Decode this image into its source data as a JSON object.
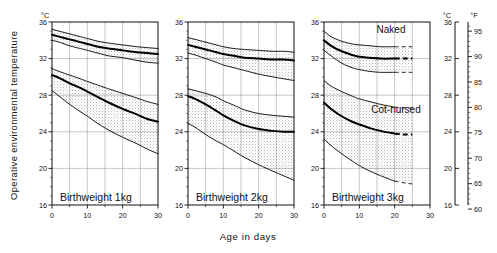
{
  "figure": {
    "ylabel": "Operative environmental temperature",
    "xlabel": "Age  in  days",
    "unit_left": "°C",
    "unit_right_c": "°C",
    "unit_right_f": "°F",
    "series_labels": {
      "naked": "Naked",
      "cot_nursed": "Cot-nursed"
    },
    "panels": [
      {
        "title": "Birthweight   1kg"
      },
      {
        "title": "Birthweight   2kg"
      },
      {
        "title": "Birthweight   3kg"
      }
    ]
  },
  "chart_data": {
    "type": "line",
    "xlabel": "Age in days",
    "ylabel": "Operative environmental temperature",
    "xlim": [
      0,
      30
    ],
    "ylim": [
      16,
      36
    ],
    "xticks": [
      0,
      10,
      20,
      30
    ],
    "xminorticks": [
      5,
      15,
      25
    ],
    "yticks": [
      16,
      20,
      24,
      28,
      32,
      36
    ],
    "y_unit": "°C",
    "secondary_axis": {
      "unit": "°F",
      "ticks": [
        60,
        65,
        70,
        75,
        80,
        85,
        90,
        95
      ],
      "lim": [
        60.8,
        96.8
      ]
    },
    "grid": true,
    "legend": "in-plot annotations",
    "annotations": [
      {
        "text": "Naked",
        "panel": 3,
        "x": 17.5,
        "y": 33.4
      },
      {
        "text": "Cot-nursed",
        "panel": 3,
        "x": 15.0,
        "y": 27.2
      },
      {
        "text": "Birthweight   1kg",
        "panel": 1,
        "x": 2.0,
        "y": 17.4
      },
      {
        "text": "Birthweight   2kg",
        "panel": 2,
        "x": 2.0,
        "y": 17.4
      },
      {
        "text": "Birthweight   3kg",
        "panel": 3,
        "x": 2.0,
        "y": 17.4
      }
    ],
    "panels": [
      {
        "name": "Birthweight 1kg",
        "x": [
          0,
          2,
          5,
          8,
          10,
          13,
          16,
          20,
          24,
          27,
          30
        ],
        "series": [
          {
            "name": "Naked upper",
            "style": "thin",
            "values": [
              35.2,
              35.0,
              34.7,
              34.4,
              34.2,
              33.9,
              33.7,
              33.5,
              33.3,
              33.2,
              33.1
            ]
          },
          {
            "name": "Naked mean",
            "style": "thick",
            "values": [
              34.6,
              34.4,
              34.1,
              33.8,
              33.6,
              33.3,
              33.1,
              32.9,
              32.7,
              32.6,
              32.5
            ]
          },
          {
            "name": "Naked lower",
            "style": "thin",
            "values": [
              34.0,
              33.8,
              33.4,
              33.1,
              32.9,
              32.6,
              32.3,
              32.1,
              31.8,
              31.6,
              31.5
            ]
          },
          {
            "name": "Cot-nursed upper",
            "style": "thin",
            "values": [
              30.9,
              30.6,
              30.2,
              29.8,
              29.5,
              29.1,
              28.7,
              28.2,
              27.7,
              27.3,
              27.0
            ]
          },
          {
            "name": "Cot-nursed mean",
            "style": "thick",
            "values": [
              30.2,
              29.9,
              29.3,
              28.8,
              28.4,
              27.8,
              27.2,
              26.5,
              25.9,
              25.4,
              25.1
            ]
          },
          {
            "name": "Cot-nursed lower",
            "style": "thin",
            "values": [
              28.5,
              27.9,
              27.0,
              26.2,
              25.7,
              24.9,
              24.2,
              23.4,
              22.7,
              22.1,
              21.6
            ]
          }
        ]
      },
      {
        "name": "Birthweight 2kg",
        "x": [
          0,
          2,
          5,
          8,
          10,
          13,
          16,
          20,
          24,
          27,
          30
        ],
        "series": [
          {
            "name": "Naked upper",
            "style": "thin",
            "values": [
              34.3,
              34.1,
              33.8,
              33.5,
              33.3,
              33.1,
              33.0,
              32.9,
              32.8,
              32.8,
              32.7
            ]
          },
          {
            "name": "Naked mean",
            "style": "thick",
            "values": [
              33.5,
              33.3,
              33.0,
              32.7,
              32.5,
              32.3,
              32.1,
              32.0,
              31.9,
              31.9,
              31.8
            ]
          },
          {
            "name": "Naked lower",
            "style": "thin",
            "values": [
              32.6,
              32.4,
              32.0,
              31.6,
              31.3,
              31.0,
              30.7,
              30.3,
              30.0,
              29.8,
              29.6
            ]
          },
          {
            "name": "Cot-nursed upper",
            "style": "thin",
            "values": [
              28.7,
              28.5,
              28.2,
              27.8,
              27.4,
              26.9,
              26.4,
              26.0,
              25.8,
              25.7,
              25.6
            ]
          },
          {
            "name": "Cot-nursed mean",
            "style": "thick",
            "values": [
              27.9,
              27.6,
              27.0,
              26.3,
              25.8,
              25.2,
              24.7,
              24.3,
              24.1,
              24.0,
              24.0
            ]
          },
          {
            "name": "Cot-nursed lower",
            "style": "thin",
            "values": [
              24.9,
              24.5,
              23.7,
              23.0,
              22.6,
              21.9,
              21.2,
              20.4,
              19.7,
              19.2,
              18.7
            ]
          }
        ]
      },
      {
        "name": "Birthweight 3kg",
        "x": [
          0,
          2,
          5,
          8,
          10,
          13,
          16,
          20,
          23,
          25
        ],
        "series": [
          {
            "name": "Naked upper",
            "style": "thin",
            "values": [
              35.0,
              34.4,
              33.9,
              33.6,
              33.5,
              33.4,
              33.3,
              33.3,
              33.3,
              33.3
            ]
          },
          {
            "name": "Naked mean",
            "style": "thick",
            "values": [
              34.0,
              33.4,
              32.8,
              32.4,
              32.2,
              32.1,
              32.0,
              32.0,
              32.0,
              32.0
            ]
          },
          {
            "name": "Naked lower",
            "style": "thin",
            "values": [
              32.9,
              32.3,
              31.5,
              31.0,
              30.8,
              30.6,
              30.5,
              30.5,
              30.5,
              30.5
            ]
          },
          {
            "name": "Cot-nursed upper",
            "style": "thin",
            "values": [
              29.6,
              29.0,
              28.4,
              27.9,
              27.6,
              27.3,
              27.0,
              26.7,
              26.6,
              26.6
            ]
          },
          {
            "name": "Cot-nursed mean",
            "style": "thick",
            "values": [
              27.2,
              26.5,
              25.7,
              25.1,
              24.8,
              24.4,
              24.1,
              23.8,
              23.7,
              23.7
            ]
          },
          {
            "name": "Cot-nursed lower",
            "style": "thin",
            "values": [
              23.2,
              22.5,
              21.6,
              20.8,
              20.3,
              19.7,
              19.2,
              18.6,
              18.4,
              18.3
            ]
          }
        ],
        "dashed_from_x": 20
      }
    ]
  }
}
